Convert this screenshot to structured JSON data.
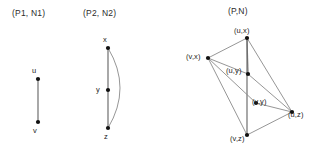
{
  "figure": {
    "background": "#ffffff",
    "edge_color": "#8a8a8a",
    "node_color": "#111111",
    "text_color": "#1d1d1d"
  },
  "panels": [
    {
      "id": "p1n1",
      "title": "(P1, N1)",
      "title_x": 12,
      "title_y": 8,
      "nodes": [
        {
          "id": "u",
          "label": "u",
          "x": 38,
          "y": 79,
          "label_x": 32,
          "label_y": 66
        },
        {
          "id": "v",
          "label": "v",
          "x": 38,
          "y": 122,
          "label_x": 33,
          "label_y": 126
        }
      ],
      "edges": [
        {
          "from": "u",
          "to": "v",
          "kind": "straight"
        }
      ]
    },
    {
      "id": "p2n2",
      "title": "(P2, N2)",
      "title_x": 83,
      "title_y": 8,
      "nodes": [
        {
          "id": "x",
          "label": "x",
          "x": 108,
          "y": 48,
          "label_x": 103,
          "label_y": 35
        },
        {
          "id": "y",
          "label": "y",
          "x": 108,
          "y": 90,
          "label_x": 96,
          "label_y": 85
        },
        {
          "id": "z",
          "label": "z",
          "x": 108,
          "y": 128,
          "label_x": 104,
          "label_y": 132
        }
      ],
      "edges": [
        {
          "from": "x",
          "to": "y",
          "kind": "straight"
        },
        {
          "from": "y",
          "to": "z",
          "kind": "straight"
        },
        {
          "from": "x",
          "to": "z",
          "kind": "arc",
          "bulge": 24
        }
      ]
    },
    {
      "id": "pn",
      "title": "(P,N)",
      "title_x": 228,
      "title_y": 6,
      "nodes": [
        {
          "id": "ux",
          "label": "(u,x)",
          "x": 247,
          "y": 38,
          "label_x": 234,
          "label_y": 26
        },
        {
          "id": "vx",
          "label": "(v,x)",
          "x": 208,
          "y": 58,
          "label_x": 186,
          "label_y": 52
        },
        {
          "id": "uy",
          "label": "(u,y)",
          "x": 248,
          "y": 74,
          "label_x": 226,
          "label_y": 66
        },
        {
          "id": "vy",
          "label": "(v,y)",
          "x": 256,
          "y": 103,
          "label_x": 252,
          "label_y": 97
        },
        {
          "id": "uz",
          "label": "(u,z)",
          "x": 292,
          "y": 112,
          "label_x": 288,
          "label_y": 110
        },
        {
          "id": "vz",
          "label": "(v,z)",
          "x": 247,
          "y": 135,
          "label_x": 230,
          "label_y": 134
        }
      ],
      "edges": [
        {
          "from": "ux",
          "to": "vx",
          "kind": "straight"
        },
        {
          "from": "ux",
          "to": "uy",
          "kind": "straight"
        },
        {
          "from": "ux",
          "to": "vz",
          "kind": "straight"
        },
        {
          "from": "ux",
          "to": "uz",
          "kind": "straight"
        },
        {
          "from": "vx",
          "to": "uy",
          "kind": "straight"
        },
        {
          "from": "vx",
          "to": "vy",
          "kind": "straight"
        },
        {
          "from": "vx",
          "to": "vz",
          "kind": "straight"
        },
        {
          "from": "uy",
          "to": "uz",
          "kind": "straight"
        },
        {
          "from": "vy",
          "to": "uz",
          "kind": "straight"
        },
        {
          "from": "vz",
          "to": "uz",
          "kind": "straight"
        }
      ]
    }
  ]
}
